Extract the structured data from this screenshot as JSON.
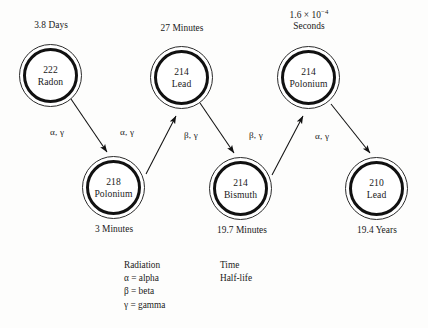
{
  "diagram": {
    "stroke_color": "#111111",
    "background": "#fdfdfc"
  },
  "nodes": [
    {
      "id": "radon-222",
      "mass": "222",
      "element": "Radon",
      "halflife": "3.8 Days",
      "halflife_position": "above"
    },
    {
      "id": "polonium-218",
      "mass": "218",
      "element": "Polonium",
      "halflife": "3 Minutes",
      "halflife_position": "below"
    },
    {
      "id": "lead-214",
      "mass": "214",
      "element": "Lead",
      "halflife": "27 Minutes",
      "halflife_position": "above"
    },
    {
      "id": "bismuth-214",
      "mass": "214",
      "element": "Bismuth",
      "halflife": "19.7 Minutes",
      "halflife_position": "below"
    },
    {
      "id": "polonium-214",
      "mass": "214",
      "element": "Polonium",
      "halflife_line1": "1.6 × 10",
      "halflife_exp": "−4",
      "halflife_line2": "Seconds",
      "halflife_position": "above"
    },
    {
      "id": "lead-210",
      "mass": "210",
      "element": "Lead",
      "halflife": "19.4 Years",
      "halflife_position": "below"
    }
  ],
  "arrows": [
    {
      "id": "rn222-to-po218",
      "label": "α, γ",
      "from": "radon-222",
      "to": "polonium-218"
    },
    {
      "id": "po218-to-pb214",
      "label": "α, γ",
      "from": "polonium-218",
      "to": "lead-214"
    },
    {
      "id": "pb214-to-bi214",
      "label": "β, γ",
      "from": "lead-214",
      "to": "bismuth-214"
    },
    {
      "id": "bi214-to-po214",
      "label": "β, γ",
      "from": "bismuth-214",
      "to": "polonium-214"
    },
    {
      "id": "po214-to-pb210",
      "label": "α, γ",
      "from": "polonium-214",
      "to": "lead-210"
    }
  ],
  "legend": {
    "radiation": {
      "heading": "Radiation",
      "items": [
        "α = alpha",
        "β = beta",
        "γ = gamma"
      ]
    },
    "time": {
      "heading": "Time",
      "items": [
        "Half-life"
      ]
    }
  }
}
